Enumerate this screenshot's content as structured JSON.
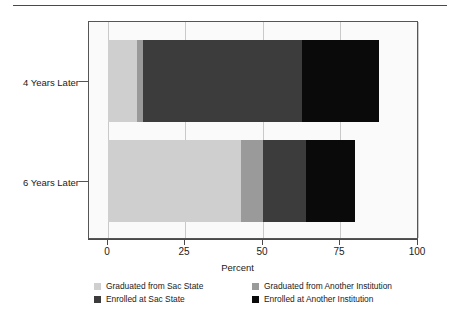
{
  "chart_data": {
    "type": "bar",
    "orientation": "horizontal",
    "stacked": true,
    "title": "",
    "xlabel": "Percent",
    "ylabel": "",
    "xlim": [
      0,
      100
    ],
    "xticks": [
      0,
      25,
      50,
      75,
      100
    ],
    "xtick_labels": [
      "0",
      "25",
      "50",
      "75",
      "100"
    ],
    "categories": [
      "4 Years Later",
      "6 Years Later"
    ],
    "grid": "vertical",
    "legend_position": "bottom",
    "series": [
      {
        "name": "Graduated from Sac State",
        "color": "#cfcfcf",
        "values": [
          9.4,
          42.9
        ]
      },
      {
        "name": "Graduated from Another Institution",
        "color": "#9a9a9a",
        "values": [
          1.9,
          7.1
        ]
      },
      {
        "name": "Enrolled at Sac State",
        "color": "#3c3c3c",
        "values": [
          51.3,
          14.0
        ]
      },
      {
        "name": "Enrolled at Another Institution",
        "color": "#0a0a0a",
        "values": [
          25.1,
          15.7
        ]
      }
    ],
    "totals": [
      87.7,
      79.7
    ]
  },
  "axis": {
    "x_title": "Percent",
    "ticks": [
      {
        "label": "0",
        "value": 0
      },
      {
        "label": "25",
        "value": 25
      },
      {
        "label": "50",
        "value": 50
      },
      {
        "label": "75",
        "value": 75
      },
      {
        "label": "100",
        "value": 100
      }
    ],
    "categories": [
      {
        "label": "4 Years Later"
      },
      {
        "label": "6 Years Later"
      }
    ]
  },
  "legend": {
    "items": [
      {
        "label": "Graduated from Sac State",
        "color": "#cfcfcf"
      },
      {
        "label": "Graduated from Another Institution",
        "color": "#9a9a9a"
      },
      {
        "label": "Enrolled at Sac State",
        "color": "#3c3c3c"
      },
      {
        "label": "Enrolled at Another Institution",
        "color": "#0a0a0a"
      }
    ]
  }
}
